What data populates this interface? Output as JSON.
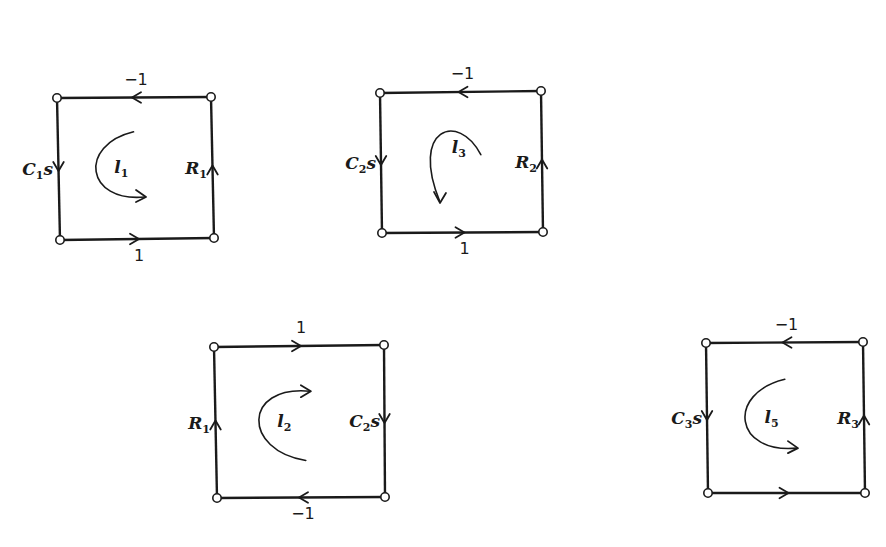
{
  "diagram": {
    "title": "",
    "loops": [
      {
        "id": "l1",
        "loop_label": "l",
        "loop_sub": "1",
        "rotation": "clockwise-lower",
        "corners": {
          "tl": [
            57,
            98
          ],
          "tr": [
            211,
            97
          ],
          "bl": [
            60,
            240
          ],
          "br": [
            214,
            238
          ]
        },
        "edges": {
          "top": {
            "gain": "−1",
            "direction": "left"
          },
          "left": {
            "gain_main": "C",
            "gain_sub": "1",
            "gain_tail": "s",
            "direction": "down"
          },
          "right": {
            "gain_main": "R",
            "gain_sub": "1",
            "gain_tail": "",
            "direction": "up"
          },
          "bottom": {
            "gain": "1",
            "direction": "right"
          }
        }
      },
      {
        "id": "l3",
        "loop_label": "l",
        "loop_sub": "3",
        "rotation": "counterclockwise-upper",
        "corners": {
          "tl": [
            380,
            93
          ],
          "tr": [
            541,
            91
          ],
          "bl": [
            382,
            233
          ],
          "br": [
            543,
            232
          ]
        },
        "edges": {
          "top": {
            "gain": "−1",
            "direction": "left"
          },
          "left": {
            "gain_main": "C",
            "gain_sub": "2",
            "gain_tail": "s",
            "direction": "down"
          },
          "right": {
            "gain_main": "R",
            "gain_sub": "2",
            "gain_tail": "",
            "direction": "up"
          },
          "bottom": {
            "gain": "1",
            "direction": "right"
          }
        }
      },
      {
        "id": "l2",
        "loop_label": "l",
        "loop_sub": "2",
        "rotation": "clockwise-upper",
        "corners": {
          "tl": [
            214,
            347
          ],
          "tr": [
            384,
            345
          ],
          "bl": [
            217,
            498
          ],
          "br": [
            385,
            497
          ]
        },
        "edges": {
          "top": {
            "gain": "1",
            "direction": "right"
          },
          "left": {
            "gain_main": "R",
            "gain_sub": "1",
            "gain_tail": "",
            "direction": "up"
          },
          "right": {
            "gain_main": "C",
            "gain_sub": "2",
            "gain_tail": "s",
            "direction": "down"
          },
          "bottom": {
            "gain": "−1",
            "direction": "left"
          }
        }
      },
      {
        "id": "l5",
        "loop_label": "l",
        "loop_sub": "5",
        "rotation": "clockwise-lower",
        "corners": {
          "tl": [
            706,
            343
          ],
          "tr": [
            863,
            342
          ],
          "bl": [
            708,
            493
          ],
          "br": [
            865,
            493
          ]
        },
        "edges": {
          "top": {
            "gain": "−1",
            "direction": "left"
          },
          "left": {
            "gain_main": "C",
            "gain_sub": "3",
            "gain_tail": "s",
            "direction": "down"
          },
          "right": {
            "gain_main": "R",
            "gain_sub": "3",
            "gain_tail": "",
            "direction": "up"
          },
          "bottom": {
            "gain": "",
            "direction": "right"
          }
        }
      }
    ]
  }
}
